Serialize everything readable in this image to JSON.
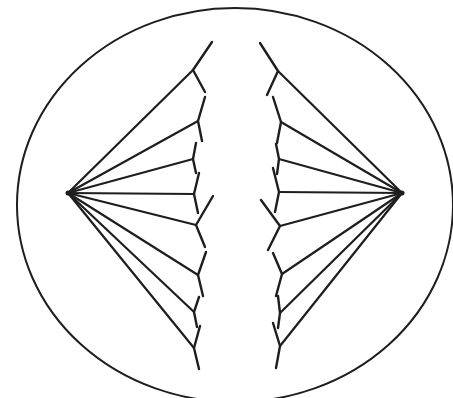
{
  "diagram": {
    "type": "mitosis-metaphase-anaphase",
    "colors": {
      "stroke": "#1e1e1e",
      "background": "#ffffff"
    },
    "cell": {
      "cx": 235,
      "cy": 205,
      "rx": 218,
      "ry": 197
    },
    "poles": {
      "left": {
        "x": 68,
        "y": 193
      },
      "right": {
        "x": 402,
        "y": 193
      }
    },
    "left_chromosomes": [
      {
        "arm_a": [
          212,
          42
        ],
        "junction": [
          193,
          70
        ],
        "arm_b": [
          205,
          92
        ]
      },
      {
        "arm_a": [
          205,
          97
        ],
        "junction": [
          198,
          121
        ],
        "arm_b": [
          202,
          141
        ]
      },
      {
        "arm_a": [
          196,
          143
        ],
        "junction": [
          193,
          159
        ],
        "arm_b": [
          196,
          173
        ]
      },
      {
        "arm_a": [
          199,
          173
        ],
        "junction": [
          194,
          194
        ],
        "arm_b": [
          198,
          213
        ]
      },
      {
        "arm_a": [
          213,
          196
        ],
        "junction": [
          196,
          225
        ],
        "arm_b": [
          205,
          247
        ]
      },
      {
        "arm_a": [
          206,
          252
        ],
        "junction": [
          198,
          275
        ],
        "arm_b": [
          203,
          296
        ]
      },
      {
        "arm_a": [
          199,
          297
        ],
        "junction": [
          194,
          312
        ],
        "arm_b": [
          197,
          327
        ]
      },
      {
        "arm_a": [
          200,
          326
        ],
        "junction": [
          194,
          348
        ],
        "arm_b": [
          199,
          369
        ]
      }
    ],
    "right_chromosomes": [
      {
        "arm_a": [
          260,
          43
        ],
        "junction": [
          278,
          71
        ],
        "arm_b": [
          267,
          95
        ]
      },
      {
        "arm_a": [
          273,
          97
        ],
        "junction": [
          281,
          122
        ],
        "arm_b": [
          277,
          143
        ]
      },
      {
        "arm_a": [
          276,
          144
        ],
        "junction": [
          279,
          159
        ],
        "arm_b": [
          277,
          174
        ]
      },
      {
        "arm_a": [
          273,
          168
        ],
        "junction": [
          279,
          192
        ],
        "arm_b": [
          275,
          212
        ]
      },
      {
        "arm_a": [
          261,
          200
        ],
        "junction": [
          280,
          226
        ],
        "arm_b": [
          268,
          250
        ]
      },
      {
        "arm_a": [
          273,
          253
        ],
        "junction": [
          282,
          274
        ],
        "arm_b": [
          276,
          296
        ]
      },
      {
        "arm_a": [
          278,
          296
        ],
        "junction": [
          280,
          313
        ],
        "arm_b": [
          278,
          328
        ]
      },
      {
        "arm_a": [
          273,
          323
        ],
        "junction": [
          280,
          346
        ],
        "arm_b": [
          276,
          368
        ]
      }
    ]
  }
}
